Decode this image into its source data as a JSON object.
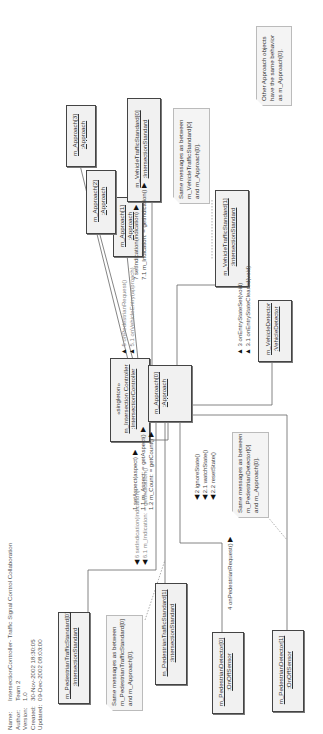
{
  "header": {
    "rows": [
      {
        "key": "Name:",
        "value": "IntersectionController- Traffic Signal Control Collaboration"
      },
      {
        "key": "Author:",
        "value": "Team 2"
      },
      {
        "key": "Version:",
        "value": "1.0"
      },
      {
        "key": "Created:",
        "value": "30-Nov-2002 18:30:05"
      },
      {
        "key": "Updated:",
        "value": "09-Dec-2002 08:03:00"
      }
    ]
  },
  "objects": {
    "controller": {
      "stereotype": "«singleton»",
      "name": "m_Intersection Controller",
      "class": ":IntersectionController"
    },
    "approach0": {
      "name": "m_Approach[0]",
      "class": ":Approach"
    },
    "approach1": {
      "name": "m_Approach[1]",
      "class": ":Approach"
    },
    "approach2": {
      "name": "m_Approach[2]",
      "class": ":Approach"
    },
    "approach3": {
      "name": "m_Approach[3]",
      "class": ":Approach"
    },
    "vts0": {
      "name": "m_VehicleTrafficStandard[0]",
      "class": ":IntersectionStandard"
    },
    "vts1": {
      "name": "m_VehicleTrafficStandard[1]",
      "class": ":IntersectionStandard"
    },
    "vdet": {
      "name": "m_VehicleDetector",
      "class": ":VehicleDetector"
    },
    "pts0": {
      "name": "m_PedestrianTrafficStandard[0]",
      "class": ":IntersectionStandard"
    },
    "pts1": {
      "name": "m_PedestrianTrafficStandard[1]",
      "class": ":IntersectionStandard"
    },
    "pdet0": {
      "name": "m_PedestrianDetector[0]",
      "class": ":OnOffSensor"
    },
    "pdet1": {
      "name": "m_PedestrianDetector[1]",
      "class": ":OnOffSensor"
    }
  },
  "notes": {
    "other_approach": [
      "Other Approach objects",
      "have the same behavior",
      "as m_Approach[0]."
    ],
    "vts_same": [
      "Same messages as between",
      "m_VehicleTrafficStandard[0]",
      "and m_Approach[0]."
    ],
    "pts_same": [
      "Same messages as between",
      "m_PedestrianTrafficStandard[0]",
      "and m_Approach[0]."
    ],
    "pdet_same": [
      "Same messages as between",
      "m_PedestrianDetector[0]",
      "and m_Approach[0]."
    ]
  },
  "messages": {
    "m1": "1 setAspect(aspect)",
    "m1_1": "1.1  m_Aspect: = getAspect()",
    "m1_2": "1.2  m_Count: = getCount()",
    "m2": "2 ignoreState()",
    "m2_1": "2.1 watchState()",
    "m2_2": "2.2 resetState()",
    "m3": "3 onEntryStateSet(void)",
    "m3_1": "3.1 onEntryStateCleared(void)",
    "m4": "4 onPedestrianRequest()",
    "m5": "5 onPedestrianRequest()",
    "m5_1": "5.1 onVehicleEntry(approach)",
    "m6": "6 setIndication(indication)",
    "m6_1": "6.1  m_Indication: = getIndication()",
    "m7": "7 setIndication(indication)",
    "m7_1": "7.1  m_Indication: = getIndication()"
  }
}
